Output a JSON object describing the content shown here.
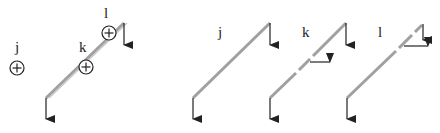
{
  "diagram": {
    "panels": [
      {
        "id": "combined",
        "nodes": [
          {
            "label": "j",
            "symbol": "plus-circle"
          },
          {
            "label": "k",
            "symbol": "plus-circle"
          },
          {
            "label": "l",
            "symbol": "plus-circle"
          }
        ]
      },
      {
        "id": "mode-j",
        "label": "j"
      },
      {
        "id": "mode-k",
        "label": "k"
      },
      {
        "id": "mode-l",
        "label": "l"
      }
    ],
    "colors": {
      "beam": "#a0a0a0",
      "ink": "#222222"
    }
  }
}
